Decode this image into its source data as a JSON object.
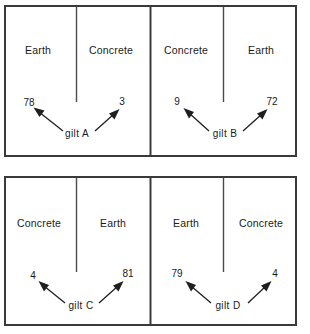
{
  "diagram": {
    "background_color": "#ffffff",
    "line_color": "#3a3a3a",
    "text_color": "#1a1a1a",
    "panels": [
      {
        "id": "panel-a",
        "gilt_label": "gilt  A",
        "left_material": "Earth",
        "right_material": "Concrete",
        "left_value": "78",
        "right_value": "3"
      },
      {
        "id": "panel-b",
        "gilt_label": "gilt  B",
        "left_material": "Concrete",
        "right_material": "Earth",
        "left_value": "9",
        "right_value": "72"
      },
      {
        "id": "panel-c",
        "gilt_label": "gilt  C",
        "left_material": "Concrete",
        "right_material": "Earth",
        "left_value": "4",
        "right_value": "81"
      },
      {
        "id": "panel-d",
        "gilt_label": "gilt  D",
        "left_material": "Earth",
        "right_material": "Concrete",
        "left_value": "79",
        "right_value": "4"
      }
    ]
  }
}
